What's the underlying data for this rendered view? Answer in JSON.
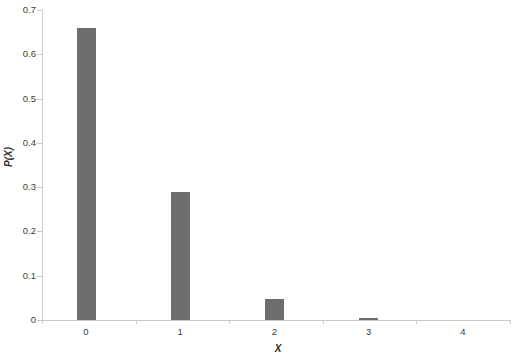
{
  "chart_data": {
    "type": "bar",
    "title": "",
    "subtitle": "",
    "xlabel": "X",
    "ylabel": "P(X)",
    "categories": [
      "0",
      "1",
      "2",
      "3",
      "4"
    ],
    "values": [
      0.66,
      0.29,
      0.047,
      0.004,
      0.0
    ],
    "series": [
      {
        "name": "P(X)",
        "values": [
          0.66,
          0.29,
          0.047,
          0.004,
          0.0
        ]
      }
    ],
    "ylim": [
      0,
      0.7
    ],
    "xlim": [
      -0.5,
      4.5
    ],
    "y_ticks": [
      "0",
      "0.1",
      "0.2",
      "0.3",
      "0.4",
      "0.5",
      "0.6",
      "0.7"
    ],
    "y_tick_values": [
      0,
      0.1,
      0.2,
      0.3,
      0.4,
      0.5,
      0.6,
      0.7
    ],
    "x_ticks": [
      "0",
      "1",
      "2",
      "3",
      "4"
    ],
    "grid": false,
    "legend": false,
    "legend_position": "none",
    "bar_color": "#6e6e6e",
    "background_color": "#ffffff",
    "axis_color": "#c8c8c8",
    "annotations": []
  },
  "figure": {
    "background_color": "#ffffff"
  }
}
